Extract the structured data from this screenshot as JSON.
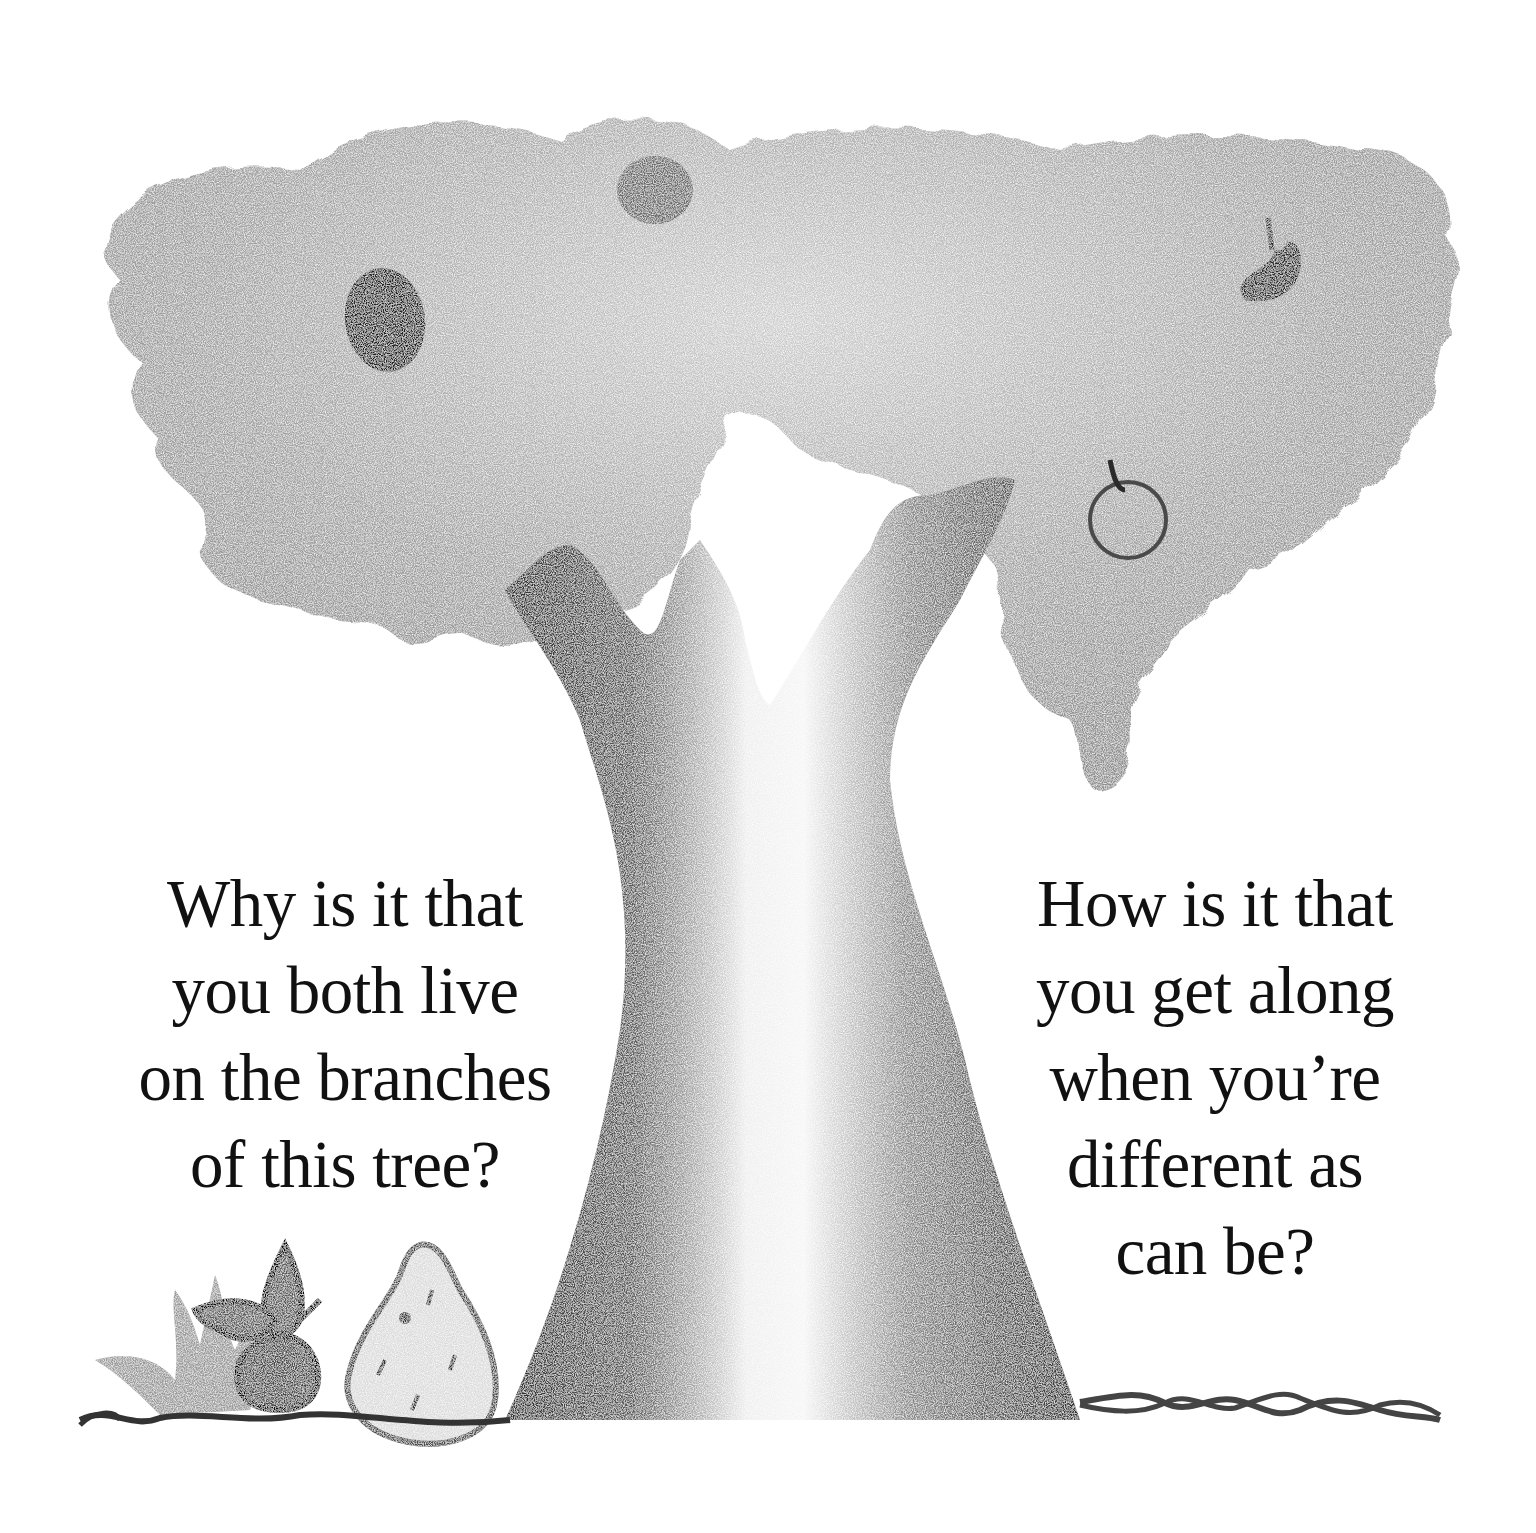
{
  "page": {
    "kind": "illustrated picture-book page",
    "illustration": {
      "subject": "tree",
      "medium": "pencil drawing, grayscale",
      "elements": [
        "tree-canopy",
        "tree-trunk",
        "fruit-dark-left",
        "fruit-top-center",
        "fruit-bitten-right",
        "fruit-outline-right",
        "grass-tuft",
        "flower",
        "pear-shaped-seed",
        "twisted-ground-line-left",
        "twisted-ground-line-right"
      ]
    },
    "colors": {
      "background": "#ffffff",
      "text": "#111111",
      "canopy": "#9a9a9a",
      "trunk_dark": "#3a3a3a",
      "trunk_light": "#f2f2f2",
      "fruit_dark": "#2a2a2a"
    }
  },
  "text_left": {
    "lines": [
      "Why is it that",
      "you both live",
      "on the branches",
      "of this tree?"
    ]
  },
  "text_right": {
    "lines": [
      "How is it that",
      "you get along",
      "when you’re",
      "different as",
      "can be?"
    ]
  }
}
